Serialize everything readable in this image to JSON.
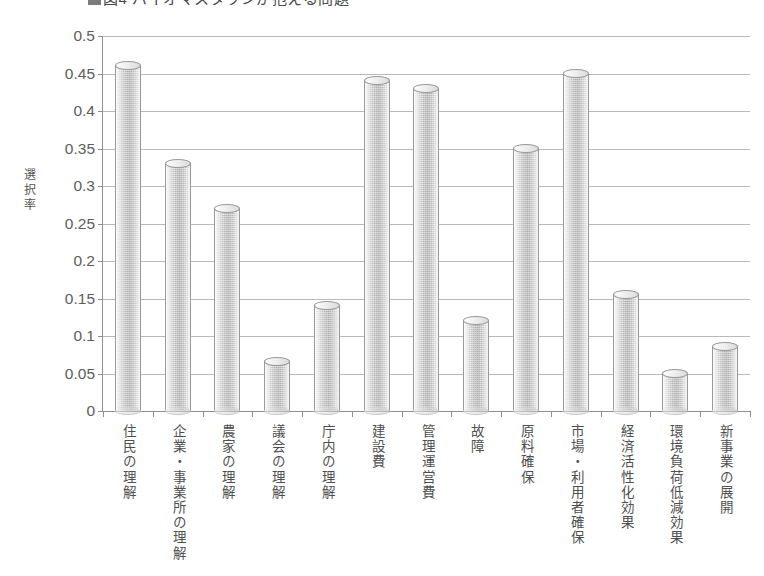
{
  "title": {
    "marker": "■",
    "text": "図4 バイオマスタウンが抱える問題"
  },
  "axis": {
    "ylabel": "選択率",
    "yticks": [
      "0",
      "0.05",
      "0.1",
      "0.15",
      "0.2",
      "0.25",
      "0.3",
      "0.35",
      "0.4",
      "0.45",
      "0.5"
    ]
  },
  "chart_data": {
    "type": "bar",
    "title": "図4 バイオマスタウンが抱える問題",
    "xlabel": "",
    "ylabel": "選択率",
    "ylim": [
      0,
      0.5
    ],
    "ytick_step": 0.05,
    "grid": true,
    "legend": false,
    "bar_style": "3d-cylinder",
    "bar_color": "#b4b4b4",
    "categories": [
      "住民の理解",
      "企業・事業所の理解",
      "農家の理解",
      "議会の理解",
      "庁内の理解",
      "建設費",
      "管理運営費",
      "故障",
      "原料確保",
      "市場・利用者確保",
      "経済活性化効果",
      "環境負荷低減効果",
      "新事業の展開"
    ],
    "values": [
      0.46,
      0.33,
      0.27,
      0.065,
      0.14,
      0.44,
      0.43,
      0.12,
      0.35,
      0.45,
      0.155,
      0.05,
      0.085
    ]
  }
}
